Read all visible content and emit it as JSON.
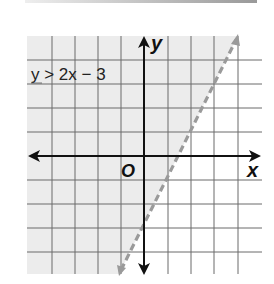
{
  "graph": {
    "inequality_label": "y > 2x − 3",
    "x_axis_label": "x",
    "y_axis_label": "y",
    "origin_label": "O",
    "boundary": {
      "slope": 2,
      "intercept": -3,
      "style": "dashed"
    },
    "shaded_region": "left of line (y > 2x − 3)",
    "colors": {
      "shade": "#ececec",
      "grid": "#6a6a6a",
      "axis": "#111111",
      "boundary": "#9a9a9a"
    }
  }
}
